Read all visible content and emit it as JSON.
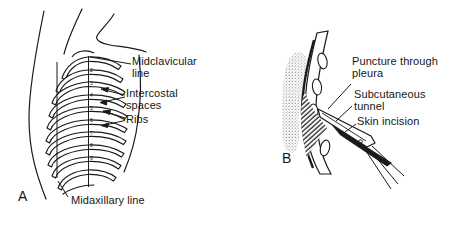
{
  "figure": {
    "background_color": "#ffffff",
    "ink_color": "#1a1a1a",
    "panel_a": {
      "label": "A",
      "annotations": {
        "midclavicular": "Midclavicular line",
        "intercostal": "Intercostal spaces",
        "ribs": "Ribs",
        "midaxillary": "Midaxillary line"
      },
      "interspace_numbers": [
        "2",
        "3",
        "4",
        "5",
        "6",
        "7",
        "8",
        "9"
      ]
    },
    "panel_b": {
      "label": "B",
      "annotations": {
        "puncture": "Puncture through pleura",
        "tunnel": "Subcutaneous tunnel",
        "incision": "Skin incision"
      }
    }
  }
}
